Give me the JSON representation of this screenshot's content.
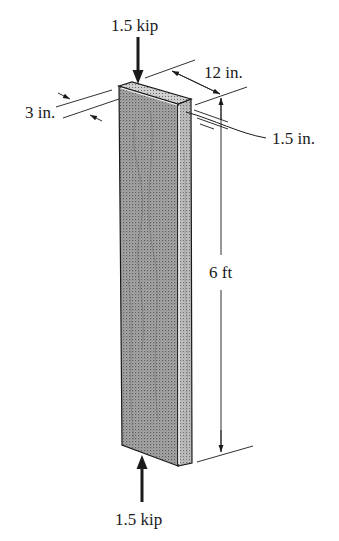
{
  "figure": {
    "top_text_fragment": "",
    "loads": {
      "top": {
        "label": "1.5 kip",
        "direction": "down"
      },
      "bottom": {
        "label": "1.5 kip",
        "direction": "up"
      }
    },
    "dimensions": {
      "width": {
        "label": "12 in."
      },
      "depth": {
        "label": "3 in."
      },
      "thickness_detail": {
        "label": "1.5 in."
      },
      "height": {
        "label": "6 ft"
      }
    },
    "colors": {
      "wood_front": "#9a9a9a",
      "wood_side": "#b5b5b5",
      "wood_top": "#c8c8c8",
      "line": "#1a1a1a",
      "highlight": "#f2f2f2"
    }
  }
}
